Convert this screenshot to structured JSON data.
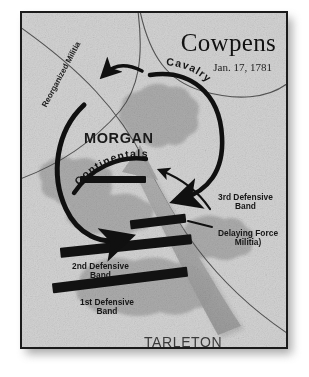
{
  "map": {
    "title": "Cowpens",
    "date": "Jan. 17, 1781",
    "commanders": {
      "american": "MORGAN",
      "british": "TARLETON"
    },
    "force_labels": {
      "reorganized_militia": "Reorganized Militia",
      "continentals": "Continentals",
      "cavalry": "Cavalry"
    },
    "annotations": {
      "band_3": "3rd Defensive\nBand",
      "delaying_force": "Delaying Force\nMilitia)",
      "band_2": "2nd Defensive\nBand",
      "band_1": "1st Defensive\nBand"
    },
    "colors": {
      "paper": "#d2d2d2",
      "woodland": "#a8a8a8",
      "unit_bar": "#121212",
      "american_arrow": "#101010",
      "british_arrow": "#9a9a9a",
      "frame": "#1b1b1b",
      "road": "#3c3c3c"
    }
  }
}
